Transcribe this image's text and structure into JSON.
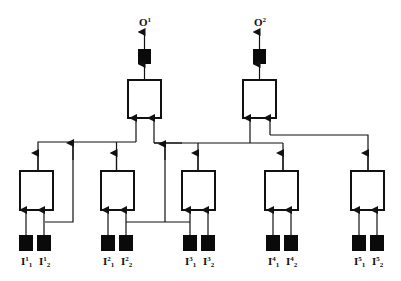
{
  "diagram": {
    "type": "hierarchical-network",
    "colors": {
      "line": "#111111",
      "fill_dark": "#0a0a0a",
      "box_fill": "#ffffff"
    },
    "outputs": [
      {
        "id": "O1",
        "label": "O",
        "sup": "1"
      },
      {
        "id": "O2",
        "label": "O",
        "sup": "2"
      }
    ],
    "inputs": [
      {
        "group": 1,
        "items": [
          {
            "label": "I",
            "sup": "1",
            "sub": "1"
          },
          {
            "label": "I",
            "sup": "1",
            "sub": "2"
          }
        ]
      },
      {
        "group": 2,
        "items": [
          {
            "label": "I",
            "sup": "2",
            "sub": "1"
          },
          {
            "label": "I",
            "sup": "2",
            "sub": "2"
          }
        ]
      },
      {
        "group": 3,
        "items": [
          {
            "label": "I",
            "sup": "3",
            "sub": "1"
          },
          {
            "label": "I",
            "sup": "3",
            "sub": "2"
          }
        ]
      },
      {
        "group": 4,
        "items": [
          {
            "label": "I",
            "sup": "4",
            "sub": "1"
          },
          {
            "label": "I",
            "sup": "4",
            "sub": "2"
          }
        ]
      },
      {
        "group": 5,
        "items": [
          {
            "label": "I",
            "sup": "5",
            "sub": "1"
          },
          {
            "label": "I",
            "sup": "5",
            "sub": "2"
          }
        ]
      }
    ],
    "labels": {
      "o1": {
        "base": "O",
        "sup": "1"
      },
      "o2": {
        "base": "O",
        "sup": "2"
      },
      "i1_1": {
        "base": "I",
        "sup": "1",
        "sub": "1"
      },
      "i1_2": {
        "base": "I",
        "sup": "1",
        "sub": "2"
      },
      "i2_1": {
        "base": "I",
        "sup": "2",
        "sub": "1"
      },
      "i2_2": {
        "base": "I",
        "sup": "2",
        "sub": "2"
      },
      "i3_1": {
        "base": "I",
        "sup": "3",
        "sub": "1"
      },
      "i3_2": {
        "base": "I",
        "sup": "3",
        "sub": "2"
      },
      "i4_1": {
        "base": "I",
        "sup": "4",
        "sub": "1"
      },
      "i4_2": {
        "base": "I",
        "sup": "4",
        "sub": "2"
      },
      "i5_1": {
        "base": "I",
        "sup": "5",
        "sub": "1"
      },
      "i5_2": {
        "base": "I",
        "sup": "5",
        "sub": "2"
      }
    }
  }
}
